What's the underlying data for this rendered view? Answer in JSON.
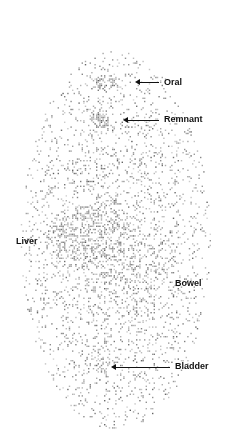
{
  "image": {
    "type": "scintigraphy-whole-body-scan",
    "background": "#ffffff",
    "dot_color": "#6a6a6a"
  },
  "regions": [
    {
      "name": "oral",
      "cx": 104,
      "cy": 82,
      "rx": 12,
      "ry": 8,
      "density": 0.55
    },
    {
      "name": "remnant",
      "cx": 101,
      "cy": 119,
      "rx": 11,
      "ry": 9,
      "density": 0.85
    },
    {
      "name": "liver",
      "cx": 92,
      "cy": 235,
      "rx": 50,
      "ry": 35,
      "density": 0.45
    },
    {
      "name": "bowel",
      "cx": 130,
      "cy": 275,
      "rx": 55,
      "ry": 40,
      "density": 0.28
    },
    {
      "name": "body",
      "cx": 115,
      "cy": 240,
      "rx": 95,
      "ry": 190,
      "density": 0.16
    },
    {
      "name": "bladder",
      "cx": 100,
      "cy": 360,
      "rx": 20,
      "ry": 15,
      "density": 0.3
    }
  ],
  "labels": [
    {
      "text": "Oral",
      "x": 164,
      "y": 77,
      "arrow": {
        "x": 139,
        "y": 82,
        "w": 20
      }
    },
    {
      "text": "Remnant",
      "x": 164,
      "y": 114,
      "arrow": {
        "x": 127,
        "y": 120,
        "w": 32
      }
    },
    {
      "text": "Liver",
      "x": 16,
      "y": 236
    },
    {
      "text": "Bowel",
      "x": 175,
      "y": 278
    },
    {
      "text": "Bladder",
      "x": 175,
      "y": 361,
      "arrow": {
        "x": 115,
        "y": 367,
        "w": 55
      }
    }
  ]
}
